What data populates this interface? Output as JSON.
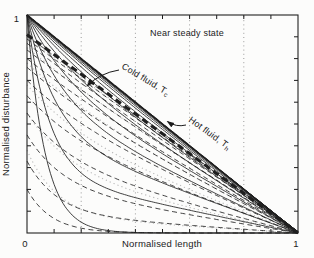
{
  "figure": {
    "background": "#fcfcfb",
    "ink": "#1b1b1b",
    "grid_color": "#9a9a9a",
    "frame_color": "#222222"
  },
  "chart_data": {
    "type": "line",
    "title": "",
    "xlabel": "Normalised length",
    "ylabel": "Normalised disturbance",
    "xlim": [
      0,
      1
    ],
    "ylim": [
      0,
      1
    ],
    "x_tick_labels": [
      "0",
      "1"
    ],
    "y_tick_labels": [
      "0",
      "1"
    ],
    "minor_tick_step": 0.1,
    "grid_x": [
      0.2,
      0.4,
      0.6,
      0.8
    ],
    "grid_style": "dotted",
    "legend_position": "none",
    "annotations": {
      "steady": {
        "text": "Near steady state"
      },
      "cold": {
        "text": "Cold fluid, T",
        "sub": "c"
      },
      "hot": {
        "text": "Hot fluid, T",
        "sub": "h"
      }
    },
    "curve_model": "y = A * ( w*exp(-k*x) + (1-w)*(1-x) ), successive time instants evolving toward the straight steady-state profile",
    "families": [
      {
        "name": "intermediate-dotted",
        "style": "dotted",
        "color": "#b9b9b9",
        "width": 1.1,
        "dash": "1.2,3",
        "curves": [
          {
            "A": 0.38,
            "w": 0.8,
            "k": 9.0
          },
          {
            "A": 0.55,
            "w": 0.5,
            "k": 6.0
          },
          {
            "A": 0.68,
            "w": 0.32,
            "k": 4.5
          },
          {
            "A": 0.78,
            "w": 0.2,
            "k": 3.4
          },
          {
            "A": 0.85,
            "w": 0.12,
            "k": 2.6
          },
          {
            "A": 0.9,
            "w": 0.07,
            "k": 2.0
          }
        ]
      },
      {
        "name": "hot-fluid-solid",
        "style": "solid",
        "color": "#1f1f1f",
        "width": 0.85,
        "dash": "",
        "curves": [
          {
            "A": 1,
            "w": 1.0,
            "k": 15.0
          },
          {
            "A": 1,
            "w": 0.74,
            "k": 12.0
          },
          {
            "A": 1,
            "w": 0.55,
            "k": 9.5
          },
          {
            "A": 1,
            "w": 0.41,
            "k": 7.6
          },
          {
            "A": 1,
            "w": 0.3,
            "k": 6.2
          },
          {
            "A": 1,
            "w": 0.22,
            "k": 5.1
          },
          {
            "A": 1,
            "w": 0.165,
            "k": 4.2
          },
          {
            "A": 1,
            "w": 0.122,
            "k": 3.6
          },
          {
            "A": 1,
            "w": 0.09,
            "k": 3.0
          },
          {
            "A": 1,
            "w": 0.067,
            "k": 2.6
          },
          {
            "A": 1,
            "w": 0.049,
            "k": 2.2
          },
          {
            "A": 1,
            "w": 0.036,
            "k": 1.9
          },
          {
            "A": 1,
            "w": 0.027,
            "k": 1.7
          },
          {
            "A": 1,
            "w": 0.02,
            "k": 1.5
          },
          {
            "A": 1,
            "w": 0.014,
            "k": 1.35
          },
          {
            "A": 1,
            "w": 0.009,
            "k": 1.2
          }
        ],
        "steady": {
          "A": 1,
          "w": 0,
          "k": 1,
          "width": 1.6,
          "dash": ""
        }
      },
      {
        "name": "cold-fluid-dashed",
        "style": "dashed",
        "color": "#1f1f1f",
        "width": 0.85,
        "dash": "5,3.5",
        "curves": [
          {
            "A": 0.2,
            "w": 1.0,
            "k": 11.0
          },
          {
            "A": 0.33,
            "w": 0.74,
            "k": 9.0
          },
          {
            "A": 0.45,
            "w": 0.55,
            "k": 7.4
          },
          {
            "A": 0.55,
            "w": 0.41,
            "k": 6.0
          },
          {
            "A": 0.63,
            "w": 0.3,
            "k": 5.0
          },
          {
            "A": 0.7,
            "w": 0.22,
            "k": 4.2
          },
          {
            "A": 0.76,
            "w": 0.165,
            "k": 3.5
          },
          {
            "A": 0.8,
            "w": 0.122,
            "k": 3.0
          },
          {
            "A": 0.84,
            "w": 0.09,
            "k": 2.5
          },
          {
            "A": 0.87,
            "w": 0.067,
            "k": 2.2
          },
          {
            "A": 0.89,
            "w": 0.049,
            "k": 1.9
          },
          {
            "A": 0.905,
            "w": 0.036,
            "k": 1.7
          }
        ],
        "steady": {
          "A": 0.91,
          "w": 0,
          "k": 1,
          "width": 3.1,
          "dash": "6.5,4.5"
        }
      }
    ]
  }
}
